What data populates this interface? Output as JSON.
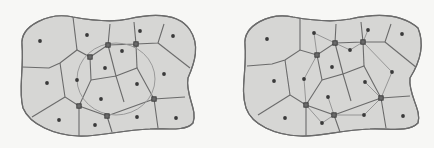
{
  "diagram": {
    "type": "voronoi-partition-comparison",
    "colors": {
      "fill": "#d6d6d4",
      "edge": "#6b6b6b",
      "site": "#3a3a3a",
      "marker": "#6a6a6a",
      "background": "#f7f7f5"
    },
    "panels": [
      {
        "id": "left",
        "outline": "M 22 45 C 20 25, 50 12, 73 17 C 95 21, 115 22, 128 19 C 150 14, 178 12, 190 30 C 200 45, 195 62, 188 78 C 185 95, 198 110, 193 123 C 185 132, 165 128, 150 129 C 120 130, 100 137, 78 136 C 55 135, 30 125, 23 108 C 18 90, 24 70, 22 45 Z",
        "edges": [
          "M 73 17 L 77 50",
          "M 22 67 L 49 68 L 60 63 L 77 50 L 90 57 L 108 45 L 110 24",
          "M 108 45 L 136 44 L 134 22",
          "M 136 44 L 158 43 L 164 24",
          "M 158 43 L 190 68",
          "M 60 63 L 65 97 L 79 106 L 91 80 L 90 57",
          "M 65 97 L 32 117",
          "M 79 106 L 79 136",
          "M 79 106 L 107 116 L 112 132",
          "M 107 116 L 154 99 L 158 128",
          "M 154 99 L 185 97",
          "M 91 80 L 116 76 L 124 102",
          "M 116 76 L 108 45",
          "M 116 76 L 137 68 L 154 99",
          "M 137 68 L 136 44"
        ],
        "circle": {
          "cx": 116,
          "cy": 79,
          "rx": 39,
          "ry": 36
        },
        "sites": [
          [
            40,
            41
          ],
          [
            87,
            35
          ],
          [
            140,
            31
          ],
          [
            173,
            36
          ],
          [
            122,
            51
          ],
          [
            105,
            68
          ],
          [
            47,
            83
          ],
          [
            77,
            80
          ],
          [
            137,
            84
          ],
          [
            164,
            74
          ],
          [
            101,
            99
          ],
          [
            59,
            120
          ],
          [
            95,
            125
          ],
          [
            137,
            117
          ],
          [
            176,
            118
          ]
        ],
        "markers": [
          [
            90,
            57
          ],
          [
            108,
            45
          ],
          [
            136,
            44
          ],
          [
            79,
            106
          ],
          [
            107,
            116
          ],
          [
            154,
            99
          ]
        ],
        "links": []
      },
      {
        "id": "right",
        "outline": "M 245 45 C 243 25, 270 12, 293 17 C 315 21, 335 22, 350 19 C 372 14, 400 12, 418 28 C 425 45, 420 62, 410 78 C 408 95, 422 110, 418 123 C 408 133, 388 128, 370 129 C 340 130, 320 137, 300 136 C 275 135, 252 125, 246 108 C 240 90, 247 70, 245 45 Z",
        "edges": [
          "M 300 17 L 300 50",
          "M 247 66 L 272 64 L 285 60 L 300 50 L 317 55 L 335 43 L 336 24",
          "M 335 43 L 363 42 L 361 22",
          "M 363 42 L 385 42 L 391 24",
          "M 385 42 L 417 68",
          "M 285 60 L 290 95 L 306 105 L 322 80 L 317 55",
          "M 290 95 L 258 115",
          "M 306 105 L 306 136",
          "M 306 105 L 334 115 L 340 132",
          "M 334 115 L 381 98 L 386 128",
          "M 381 98 L 410 96",
          "M 322 80 L 343 74 L 351 101",
          "M 343 74 L 335 43",
          "M 343 74 L 364 66 L 381 98",
          "M 364 66 L 363 42"
        ],
        "circle": null,
        "sites": [
          [
            267,
            39
          ],
          [
            314,
            33
          ],
          [
            368,
            30
          ],
          [
            402,
            34
          ],
          [
            350,
            50
          ],
          [
            332,
            67
          ],
          [
            274,
            81
          ],
          [
            304,
            79
          ],
          [
            365,
            82
          ],
          [
            392,
            72
          ],
          [
            328,
            97
          ],
          [
            285,
            118
          ],
          [
            322,
            123
          ],
          [
            364,
            115
          ],
          [
            403,
            116
          ]
        ],
        "markers": [
          [
            317,
            55
          ],
          [
            335,
            43
          ],
          [
            363,
            42
          ],
          [
            306,
            105
          ],
          [
            334,
            115
          ],
          [
            381,
            98
          ]
        ],
        "links": [
          [
            [
              314,
              33
            ],
            [
              317,
              55
            ]
          ],
          [
            [
              314,
              33
            ],
            [
              335,
              43
            ]
          ],
          [
            [
              335,
              43
            ],
            [
              350,
              50
            ]
          ],
          [
            [
              350,
              50
            ],
            [
              363,
              42
            ]
          ],
          [
            [
              363,
              42
            ],
            [
              368,
              30
            ]
          ],
          [
            [
              363,
              42
            ],
            [
              392,
              72
            ]
          ],
          [
            [
              317,
              55
            ],
            [
              304,
              79
            ]
          ],
          [
            [
              304,
              79
            ],
            [
              306,
              105
            ]
          ],
          [
            [
              306,
              105
            ],
            [
              322,
              123
            ]
          ],
          [
            [
              322,
              123
            ],
            [
              334,
              115
            ]
          ],
          [
            [
              334,
              115
            ],
            [
              364,
              115
            ]
          ],
          [
            [
              334,
              115
            ],
            [
              328,
              97
            ]
          ],
          [
            [
              364,
              115
            ],
            [
              381,
              98
            ]
          ],
          [
            [
              381,
              98
            ],
            [
              392,
              72
            ]
          ],
          [
            [
              381,
              98
            ],
            [
              365,
              82
            ]
          ]
        ]
      }
    ]
  }
}
